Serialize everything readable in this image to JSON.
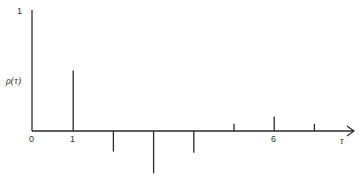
{
  "chart_data": {
    "type": "bar",
    "subtype": "stem",
    "title": "",
    "xlabel": "τ",
    "ylabel": "ρ(τ)",
    "categories": [
      1,
      2,
      3,
      4,
      5,
      6,
      7
    ],
    "values": [
      0.5,
      -0.17,
      -0.35,
      -0.18,
      0.06,
      0.12,
      0.06
    ],
    "x_tick_labels": [
      "0",
      "1",
      "6"
    ],
    "y_tick_labels": [
      "1"
    ],
    "ylim": [
      -0.4,
      1
    ],
    "xlim": [
      0,
      8
    ],
    "grid": false,
    "legend": null
  },
  "labels": {
    "y_top": "1",
    "origin": "0",
    "x_one": "1",
    "x_six": "6",
    "ylabel": "ρ(τ)",
    "xlabel": "τ"
  },
  "colors": {
    "line": "#2a2a2a",
    "background": "#ffffff"
  }
}
